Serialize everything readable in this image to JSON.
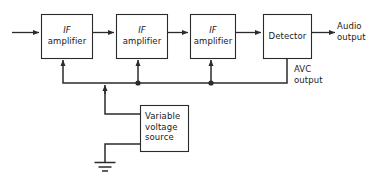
{
  "diagram": {
    "stroke_color": "#2b2b2b",
    "text_color": "#1a1a1a",
    "background": "#ffffff",
    "blocks": [
      {
        "id": "if1",
        "line1": "IF",
        "line2": "amplifier",
        "emphasis": "italic-first-line"
      },
      {
        "id": "if2",
        "line1": "IF",
        "line2": "amplifier",
        "emphasis": "italic-first-line"
      },
      {
        "id": "if3",
        "line1": "IF",
        "line2": "amplifier",
        "emphasis": "italic-first-line"
      },
      {
        "id": "detector",
        "line1": "Detector",
        "line2": "",
        "emphasis": "none"
      },
      {
        "id": "source",
        "line1": "Variable",
        "line2": "voltage",
        "line3": "source",
        "emphasis": "none"
      }
    ],
    "labels": [
      {
        "id": "audio-output",
        "line1": "Audio",
        "line2": "output"
      },
      {
        "id": "avc-output",
        "line1": "AVC",
        "line2": "output"
      }
    ],
    "symbols": [
      {
        "id": "ground",
        "name": "ground-symbol"
      }
    ]
  }
}
